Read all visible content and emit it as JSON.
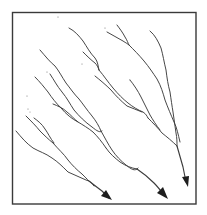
{
  "diagram": {
    "type": "dendritic-drainage-pattern",
    "frame": {
      "x": 12,
      "y": 12,
      "width": 184,
      "height": 192
    },
    "colors": {
      "background": "#ffffff",
      "line": "#3c3c3c",
      "frame": "#3a3a3a",
      "arrowhead": "#1e1e1e"
    },
    "channels": [
      {
        "name": "left-system",
        "outlet_arrow": [
          112,
          200
        ]
      },
      {
        "name": "middle-system",
        "outlet_arrow": [
          168,
          199
        ]
      },
      {
        "name": "right-system",
        "outlet_arrow": [
          188,
          187
        ]
      }
    ],
    "labels": []
  }
}
